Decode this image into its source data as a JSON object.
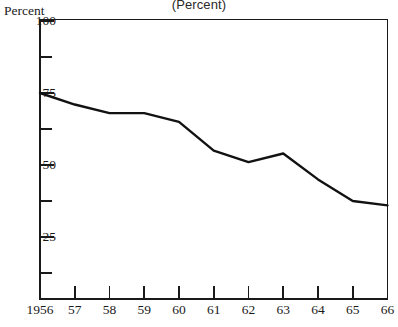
{
  "chart_data": {
    "type": "line",
    "title": "(Percent)",
    "xlabel": "",
    "ylabel": "Percent",
    "ylim": [
      0,
      100
    ],
    "xlim": [
      1956,
      1966
    ],
    "grid": false,
    "legend": null,
    "y_ticks_major": [
      100,
      75,
      50,
      25
    ],
    "y_ticks_minor": [
      87.5,
      62.5,
      37.5,
      12.5
    ],
    "y_tick_labels": [
      "100",
      "75",
      "50",
      "25"
    ],
    "categories": [
      1956,
      1957,
      1958,
      1959,
      1960,
      1961,
      1962,
      1963,
      1964,
      1965,
      1966
    ],
    "x_tick_labels": [
      "1956",
      "57",
      "58",
      "59",
      "60",
      "61",
      "62",
      "63",
      "64",
      "65",
      "66"
    ],
    "values": [
      75,
      71,
      68,
      68,
      65,
      55,
      51,
      54,
      45,
      37.5,
      36
    ],
    "series": [
      {
        "name": "Percent",
        "values": [
          75,
          71,
          68,
          68,
          65,
          55,
          51,
          54,
          45,
          37.5,
          36
        ]
      }
    ],
    "line_color": "#121212",
    "axis_color": "#1a1a1a",
    "background_color": "#ffffff"
  }
}
